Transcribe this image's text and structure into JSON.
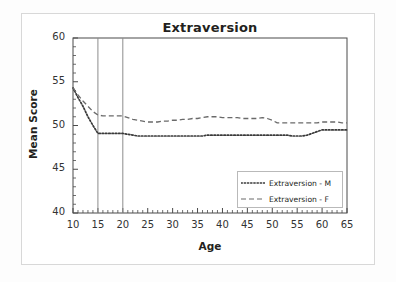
{
  "chart_data": {
    "type": "line",
    "title": "Extraversion",
    "xlabel": "Age",
    "ylabel": "Mean Score",
    "xlim": [
      10,
      65
    ],
    "ylim": [
      40,
      60
    ],
    "x_major_ticks": [
      10,
      15,
      20,
      25,
      30,
      35,
      40,
      45,
      50,
      55,
      60,
      65
    ],
    "y_major_ticks": [
      40,
      45,
      50,
      55,
      60
    ],
    "x_minor_tick_step": 1,
    "y_minor_tick_step": 1,
    "grid": false,
    "legend_position": "inside lower right",
    "vertical_reference_lines": [
      15,
      20
    ],
    "x": [
      10,
      11,
      12,
      13,
      14,
      15,
      16,
      17,
      18,
      19,
      20,
      21,
      22,
      23,
      24,
      25,
      26,
      27,
      28,
      29,
      30,
      31,
      32,
      33,
      34,
      35,
      36,
      37,
      38,
      39,
      40,
      41,
      42,
      43,
      44,
      45,
      46,
      47,
      48,
      49,
      50,
      51,
      52,
      53,
      54,
      55,
      56,
      57,
      58,
      59,
      60,
      61,
      62,
      63,
      64,
      65
    ],
    "series": [
      {
        "name": "Extraversion - M",
        "style": "dotted",
        "color": "#3a3a3a",
        "values": [
          54.3,
          53.2,
          52.2,
          51.0,
          50.0,
          49.1,
          49.1,
          49.1,
          49.1,
          49.1,
          49.1,
          49.0,
          48.9,
          48.8,
          48.8,
          48.8,
          48.8,
          48.8,
          48.8,
          48.8,
          48.8,
          48.8,
          48.8,
          48.8,
          48.8,
          48.8,
          48.8,
          48.9,
          48.9,
          48.9,
          48.9,
          48.9,
          48.9,
          48.9,
          48.9,
          48.9,
          48.9,
          48.9,
          48.9,
          48.9,
          48.9,
          48.9,
          48.9,
          48.9,
          48.8,
          48.8,
          48.8,
          48.9,
          49.1,
          49.3,
          49.5,
          49.5,
          49.5,
          49.5,
          49.5,
          49.5
        ]
      },
      {
        "name": "Extraversion - F",
        "style": "dashed",
        "color": "#6a6a6a",
        "values": [
          54.3,
          53.5,
          52.8,
          52.2,
          51.6,
          51.2,
          51.1,
          51.1,
          51.1,
          51.1,
          51.1,
          50.9,
          50.7,
          50.6,
          50.5,
          50.4,
          50.4,
          50.4,
          50.5,
          50.5,
          50.6,
          50.6,
          50.7,
          50.7,
          50.8,
          50.8,
          50.9,
          51.0,
          51.0,
          51.0,
          50.9,
          50.9,
          50.9,
          50.9,
          50.8,
          50.8,
          50.8,
          50.8,
          50.9,
          50.8,
          50.6,
          50.3,
          50.3,
          50.3,
          50.3,
          50.3,
          50.3,
          50.3,
          50.3,
          50.3,
          50.4,
          50.4,
          50.4,
          50.4,
          50.3,
          50.3
        ]
      }
    ]
  },
  "legend": {
    "items": [
      {
        "label": "Extraversion - M",
        "style": "dotted"
      },
      {
        "label": "Extraversion - F",
        "style": "dashed"
      }
    ]
  }
}
